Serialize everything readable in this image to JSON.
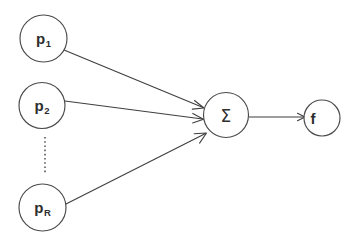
{
  "diagram": {
    "background_color": "#ffffff",
    "stroke_color": "#3f3f3f",
    "node_stroke_color": "#4a4a4a",
    "label_color": "#2e2e2e",
    "width": 359,
    "height": 245,
    "input_nodes": [
      {
        "id": "p1",
        "base": "p",
        "subscript": "1",
        "cx": 43.5,
        "cy": 38.5,
        "r": 23.5,
        "label_x": 43.5,
        "label_y": 39
      },
      {
        "id": "p2",
        "base": "p",
        "subscript": "2",
        "cx": 42.0,
        "cy": 105.5,
        "r": 23.0,
        "label_x": 42.0,
        "label_y": 106
      },
      {
        "id": "pR",
        "base": "p",
        "subscript": "R",
        "cx": 42.5,
        "cy": 207.5,
        "r": 23.5,
        "label_x": 42.5,
        "label_y": 208
      }
    ],
    "ellipsis": {
      "name": "vertical-ellipsis",
      "x": 45,
      "y_start": 137,
      "y_end": 173
    },
    "sum_node": {
      "id": "sum",
      "label": "Σ",
      "cx": 226,
      "cy": 115,
      "r": 22.5,
      "label_x": 226,
      "label_y": 116
    },
    "output_node": {
      "id": "f",
      "label": "f",
      "cx": 322,
      "cy": 118,
      "r": 18,
      "label_x": 313,
      "label_y": 118
    },
    "edges": [
      {
        "name": "edge-p1-to-sum",
        "from": "p1",
        "to": "sum",
        "x1": 64,
        "y1": 50,
        "x2": 204,
        "y2": 108
      },
      {
        "name": "edge-p2-to-sum",
        "from": "p2",
        "to": "sum",
        "x1": 65,
        "y1": 101,
        "x2": 203,
        "y2": 119
      },
      {
        "name": "edge-pR-to-sum",
        "from": "pR",
        "to": "sum",
        "x1": 64,
        "y1": 205,
        "x2": 206,
        "y2": 133
      },
      {
        "name": "edge-sum-to-f",
        "from": "sum",
        "to": "f",
        "x1": 249,
        "y1": 117,
        "x2": 304,
        "y2": 117
      }
    ]
  }
}
